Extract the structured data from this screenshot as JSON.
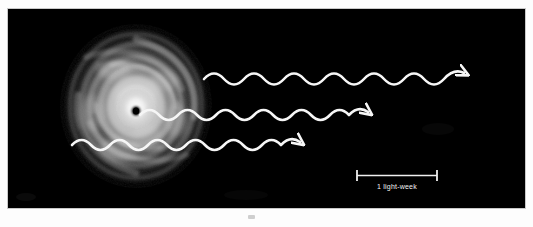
{
  "figure": {
    "kind": "astronomy-illustration",
    "background_color": "#000000",
    "paper_color": "#fdfdfd",
    "frame_border_color": "#c9c9c9"
  },
  "scene": {
    "accretion_disk": {
      "label": "accretion-disk",
      "center_x": 135,
      "center_y": 105,
      "radius_x": 76,
      "radius_y": 82,
      "glow_color": "#f4f4f4"
    },
    "black_hole": {
      "label": "black-hole",
      "center_x": 135,
      "center_y": 110,
      "radius": 4,
      "color": "#000000"
    },
    "waves": [
      {
        "name": "upper-radiation-wave",
        "start_x": 203,
        "end_x": 447,
        "baseline_y": 76,
        "amplitude": 9,
        "wavelength": 40,
        "stroke": "#f6f6f6",
        "stroke_width": 2.6,
        "arrowhead": true
      },
      {
        "name": "middle-radiation-wave",
        "start_x": 138,
        "end_x": 363,
        "baseline_y": 113,
        "amplitude": 8,
        "wavelength": 37,
        "stroke": "#f6f6f6",
        "stroke_width": 2.6,
        "arrowhead": true
      },
      {
        "name": "lower-radiation-wave",
        "start_x": 70,
        "end_x": 302,
        "baseline_y": 142,
        "amplitude": 8,
        "wavelength": 37,
        "stroke": "#f6f6f6",
        "stroke_width": 2.6,
        "arrowhead": true
      }
    ],
    "scale_bar": {
      "label": "1 light-week",
      "x_start": 356,
      "x_end": 436,
      "y": 168,
      "cap_height": 11,
      "stroke": "#f0f0f0",
      "text_x": 396,
      "text_y": 182,
      "text_color": "#f2f2f2"
    }
  },
  "colors": {
    "plate_black": "#000000",
    "wave_white": "#f6f6f6",
    "disk_white": "#ffffff",
    "caption_white": "#f2f2f2"
  }
}
